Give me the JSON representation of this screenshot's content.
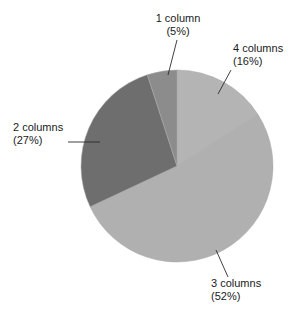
{
  "chart_data": {
    "type": "pie",
    "title": "",
    "subtitle": "",
    "xlabel": "",
    "ylabel": "",
    "legend_position": "none",
    "grid": false,
    "units": "percent",
    "total": 100,
    "start_angle_deg": 0,
    "direction": "clockwise",
    "categories": [
      "4 columns",
      "3 columns",
      "2 columns",
      "1 column"
    ],
    "values": [
      16,
      52,
      27,
      5
    ],
    "slices": [
      {
        "label": "4 columns",
        "value": 16,
        "percent_text": "(16%)",
        "color": "#b4b4b4",
        "start_deg": 0,
        "end_deg": 57.6
      },
      {
        "label": "3 columns",
        "value": 52,
        "percent_text": "(52%)",
        "color": "#b0b0b0",
        "start_deg": 57.6,
        "end_deg": 244.8
      },
      {
        "label": "2 columns",
        "value": 27,
        "percent_text": "(27%)",
        "color": "#6e6e6e",
        "start_deg": 244.8,
        "end_deg": 342.0
      },
      {
        "label": "1 column",
        "value": 5,
        "percent_text": "(5%)",
        "color": "#8c8c8c",
        "start_deg": 342.0,
        "end_deg": 360.0
      }
    ],
    "annotations": [
      {
        "name": "1-column",
        "line1": "1 column",
        "line2": "(5%)",
        "text_anchor": "middle",
        "x": 178,
        "y": 22,
        "line_x1": 177,
        "line_y1": 40,
        "line_x2": 168,
        "line_y2": 75
      },
      {
        "name": "4-columns",
        "line1": "4 columns",
        "line2": "(16%)",
        "text_anchor": "start",
        "x": 233,
        "y": 52,
        "line_x1": 231,
        "line_y1": 70,
        "line_x2": 218,
        "line_y2": 94
      },
      {
        "name": "2-columns",
        "line1": "2 columns",
        "line2": "(27%)",
        "text_anchor": "start",
        "x": 13,
        "y": 131,
        "line_x1": 68,
        "line_y1": 142,
        "line_x2": 100,
        "line_y2": 142
      },
      {
        "name": "3-columns",
        "line1": "3 columns",
        "line2": "(52%)",
        "text_anchor": "start",
        "x": 211,
        "y": 287,
        "line_x1": 228,
        "line_y1": 277,
        "line_x2": 216,
        "line_y2": 250
      }
    ],
    "geometry": {
      "center_x": 177,
      "center_y": 166,
      "radius": 96
    },
    "background_color": "#ffffff",
    "text_color": "#1a1a1a"
  }
}
